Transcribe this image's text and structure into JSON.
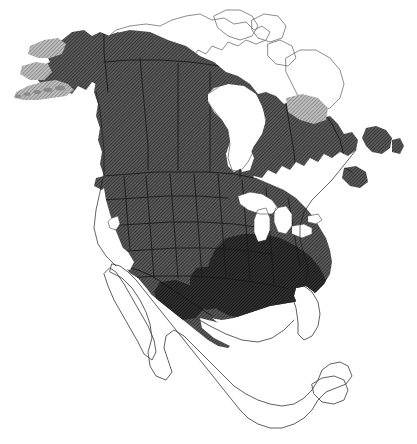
{
  "figure": {
    "kind": "species-range-map",
    "title": "",
    "caption": "",
    "continent": "North America",
    "background_color": "#ffffff",
    "width": 417,
    "height": 444,
    "has_legend": false,
    "has_labels": false,
    "has_axes": false,
    "has_scale_bar": false
  },
  "style": {
    "outline_color": "#6e6e6e",
    "outline_color_strong": "#3c3c3c",
    "outline_width": 0.8,
    "internal_border_color": "#1c1c1c",
    "internal_border_width": 0.9,
    "hatch_angle_deg": 45,
    "hatch_spacing_px": 2.0,
    "water_color": "#ffffff",
    "unshaded_land_color": "#ffffff"
  },
  "shading_classes": [
    {
      "id": "dense",
      "label": "core range",
      "fill_color": "#2a2a2a",
      "hatch_color": "#111111",
      "base_color": "#313131",
      "coverage": "southeastern United States, lower Mississippi valley, Gulf coastal plain"
    },
    {
      "id": "medium",
      "label": "primary range",
      "fill_color": "#4a4a4a",
      "hatch_color": "#262626",
      "base_color": "#5a5a5a",
      "coverage": "Alaska, most of Canada south of the treeline, all of the conterminous United States, northern Mexico"
    },
    {
      "id": "sparse",
      "label": "peripheral range",
      "fill_color": "#9a9a9a",
      "hatch_color": "#6a6a6a",
      "base_color": "#bdbdbd",
      "coverage": "Aleutian chain, Seward Peninsula fringe, northern Quebec / Ungava fringe"
    },
    {
      "id": "absent",
      "label": "outside range",
      "fill_color": "#ffffff",
      "hatch_color": "#ffffff",
      "base_color": "#ffffff",
      "coverage": "Canadian Arctic Archipelago, Greenland margin, central and southern Mexico, Florida peninsula, Baja California, Yucatan"
    }
  ],
  "regions": [
    {
      "name": "alaska-mainland",
      "shading": "medium"
    },
    {
      "name": "aleutian-chain",
      "shading": "sparse"
    },
    {
      "name": "yukon-northwest-territories",
      "shading": "medium"
    },
    {
      "name": "british-columbia",
      "shading": "medium"
    },
    {
      "name": "prairie-provinces",
      "shading": "medium"
    },
    {
      "name": "ontario-quebec",
      "shading": "medium"
    },
    {
      "name": "ungava-northern-quebec",
      "shading": "sparse"
    },
    {
      "name": "labrador",
      "shading": "medium"
    },
    {
      "name": "newfoundland",
      "shading": "medium"
    },
    {
      "name": "maritime-provinces",
      "shading": "medium"
    },
    {
      "name": "conterminous-united-states",
      "shading": "medium"
    },
    {
      "name": "southeastern-united-states",
      "shading": "dense"
    },
    {
      "name": "northern-mexico",
      "shading": "medium"
    },
    {
      "name": "canadian-arctic-archipelago",
      "shading": "absent"
    },
    {
      "name": "central-southern-mexico",
      "shading": "absent"
    },
    {
      "name": "florida-peninsula",
      "shading": "absent"
    },
    {
      "name": "baja-california",
      "shading": "absent"
    },
    {
      "name": "yucatan-peninsula",
      "shading": "absent"
    }
  ],
  "water_bodies": [
    {
      "name": "hudson-bay"
    },
    {
      "name": "great-lakes"
    },
    {
      "name": "gulf-of-mexico"
    },
    {
      "name": "gulf-of-california"
    },
    {
      "name": "great-salt-lake"
    },
    {
      "name": "pacific-coast-inlet"
    }
  ]
}
